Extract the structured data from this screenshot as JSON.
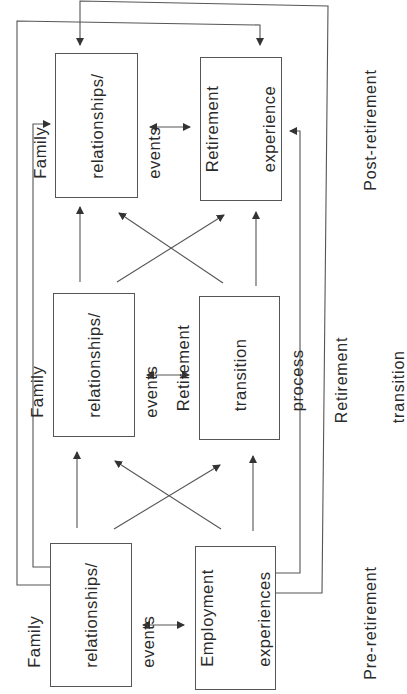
{
  "diagram": {
    "type": "conceptual-flow",
    "stroke_color": "#555555",
    "text_color": "#2a2a2a",
    "stages": [
      {
        "id": "post",
        "label": "Post-retirement"
      },
      {
        "id": "transition",
        "label_lines": [
          "Retirement",
          "transition"
        ]
      },
      {
        "id": "pre",
        "label": "Pre-retirement"
      }
    ],
    "boxes": {
      "post_family": {
        "lines": [
          "Family",
          "relationships/",
          "events"
        ]
      },
      "post_retirement": {
        "lines": [
          "Retirement",
          "experience"
        ]
      },
      "mid_family": {
        "lines": [
          "Family",
          "relationships/",
          "events"
        ]
      },
      "mid_retirement": {
        "lines": [
          "Retirement",
          "transition",
          "process"
        ]
      },
      "pre_family": {
        "lines": [
          "Family",
          "relationships/",
          "events"
        ]
      },
      "pre_employment": {
        "lines": [
          "Employment",
          "experiences"
        ]
      }
    },
    "edges": [
      {
        "from": "pre_family",
        "to": "mid_family",
        "type": "arrow"
      },
      {
        "from": "pre_family",
        "to": "mid_retirement",
        "type": "arrow"
      },
      {
        "from": "pre_employment",
        "to": "mid_family",
        "type": "arrow"
      },
      {
        "from": "pre_employment",
        "to": "mid_retirement",
        "type": "arrow"
      },
      {
        "from": "mid_family",
        "to": "post_family",
        "type": "arrow"
      },
      {
        "from": "mid_family",
        "to": "post_retirement",
        "type": "arrow"
      },
      {
        "from": "mid_retirement",
        "to": "post_family",
        "type": "arrow"
      },
      {
        "from": "mid_retirement",
        "to": "post_retirement",
        "type": "arrow"
      },
      {
        "from": "pre_family",
        "to": "pre_employment",
        "type": "bidirectional"
      },
      {
        "from": "mid_family",
        "to": "mid_retirement",
        "type": "bidirectional"
      },
      {
        "from": "post_family",
        "to": "post_retirement",
        "type": "bidirectional"
      },
      {
        "from": "pre_family",
        "to": "post_family",
        "type": "arrow",
        "route": "left-inner"
      },
      {
        "from": "pre_family",
        "to": "post_retirement",
        "type": "arrow",
        "route": "left-outer-top"
      },
      {
        "from": "pre_employment",
        "to": "post_retirement",
        "type": "arrow",
        "route": "right-inner"
      },
      {
        "from": "pre_employment",
        "to": "post_family",
        "type": "arrow",
        "route": "right-outer-top"
      }
    ]
  }
}
